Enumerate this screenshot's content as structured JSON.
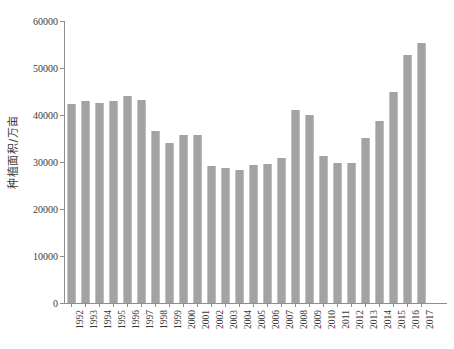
{
  "chart_data": {
    "type": "bar",
    "title": "",
    "xlabel": "",
    "ylabel": "种植面积/万亩",
    "ylim": [
      0,
      60000
    ],
    "ytick_labels": [
      "0",
      "10000",
      "20000",
      "30000",
      "40000",
      "50000",
      "60000"
    ],
    "yticks": [
      0,
      10000,
      20000,
      30000,
      40000,
      50000,
      60000
    ],
    "grid": false,
    "legend": "none",
    "bar_color": "#a3a3a3",
    "categories": [
      "1992",
      "1993",
      "1994",
      "1995",
      "1996",
      "1997",
      "1998",
      "1999",
      "2000",
      "2001",
      "2002",
      "2003",
      "2004",
      "2005",
      "2006",
      "2007",
      "2008",
      "2009",
      "2010",
      "2011",
      "2012",
      "2013",
      "2014",
      "2015",
      "2016",
      "2017"
    ],
    "values": [
      42300,
      43000,
      42500,
      43000,
      44000,
      43200,
      36500,
      34000,
      35800,
      35700,
      29200,
      28800,
      28200,
      29300,
      29500,
      30800,
      41000,
      39900,
      31200,
      29800,
      29800,
      35200,
      38800,
      44800,
      52800,
      55400
    ]
  }
}
